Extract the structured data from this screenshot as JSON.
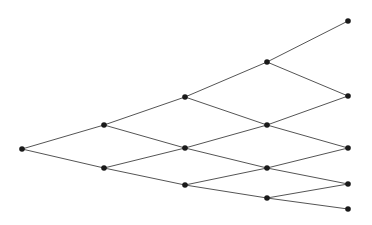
{
  "diagram": {
    "type": "tree",
    "colors": {
      "edge": "#555555",
      "node": "#1a1a1a",
      "background": "#ffffff"
    },
    "node_radius": 2.8,
    "nodes": [
      {
        "id": "n0",
        "x": 22,
        "y": 149
      },
      {
        "id": "n1a",
        "x": 104,
        "y": 125
      },
      {
        "id": "n1b",
        "x": 104,
        "y": 168
      },
      {
        "id": "n2a",
        "x": 185,
        "y": 97
      },
      {
        "id": "n2b",
        "x": 185,
        "y": 148
      },
      {
        "id": "n2c",
        "x": 185,
        "y": 185
      },
      {
        "id": "n3a",
        "x": 267,
        "y": 62
      },
      {
        "id": "n3b",
        "x": 267,
        "y": 125
      },
      {
        "id": "n3c",
        "x": 267,
        "y": 168
      },
      {
        "id": "n3d",
        "x": 267,
        "y": 198
      },
      {
        "id": "n4a",
        "x": 348,
        "y": 21
      },
      {
        "id": "n4b",
        "x": 348,
        "y": 96
      },
      {
        "id": "n4c",
        "x": 348,
        "y": 148
      },
      {
        "id": "n4d",
        "x": 348,
        "y": 184
      },
      {
        "id": "n4e",
        "x": 348,
        "y": 209
      }
    ],
    "edges": [
      [
        "n0",
        "n1a"
      ],
      [
        "n0",
        "n1b"
      ],
      [
        "n1a",
        "n2a"
      ],
      [
        "n1a",
        "n2b"
      ],
      [
        "n1b",
        "n2b"
      ],
      [
        "n1b",
        "n2c"
      ],
      [
        "n2a",
        "n3a"
      ],
      [
        "n2a",
        "n3b"
      ],
      [
        "n2b",
        "n3b"
      ],
      [
        "n2b",
        "n3c"
      ],
      [
        "n2c",
        "n3c"
      ],
      [
        "n2c",
        "n3d"
      ],
      [
        "n3a",
        "n4a"
      ],
      [
        "n3a",
        "n4b"
      ],
      [
        "n3b",
        "n4b"
      ],
      [
        "n3b",
        "n4c"
      ],
      [
        "n3c",
        "n4c"
      ],
      [
        "n3c",
        "n4d"
      ],
      [
        "n3d",
        "n4d"
      ],
      [
        "n3d",
        "n4e"
      ]
    ]
  }
}
